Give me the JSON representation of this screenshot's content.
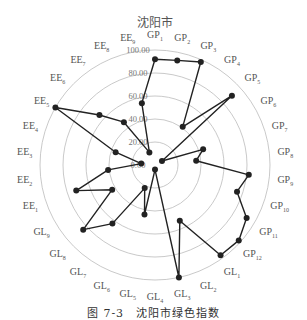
{
  "chart_data": {
    "type": "radar",
    "title": "沈阳市",
    "caption": "图 7-3　沈阳市绿色指数",
    "axes": [
      "GP1",
      "GP2",
      "GP3",
      "GP4",
      "GP5",
      "GP6",
      "GP7",
      "GP8",
      "GP9",
      "GP10",
      "GP11",
      "GP12",
      "GL1",
      "GL2",
      "GL3",
      "GL4",
      "GL5",
      "GL6",
      "GL7",
      "GL8",
      "GL9",
      "EE1",
      "EE2",
      "EE3",
      "EE4",
      "EE5",
      "EE6",
      "EE7",
      "EE8",
      "EE9"
    ],
    "axis_labels": [
      {
        "base": "GP",
        "sub": "1"
      },
      {
        "base": "GP",
        "sub": "2"
      },
      {
        "base": "GP",
        "sub": "3"
      },
      {
        "base": "GP",
        "sub": "4"
      },
      {
        "base": "GP",
        "sub": "5"
      },
      {
        "base": "GP",
        "sub": "6"
      },
      {
        "base": "GP",
        "sub": "7"
      },
      {
        "base": "GP",
        "sub": "8"
      },
      {
        "base": "GP",
        "sub": "9"
      },
      {
        "base": "GP",
        "sub": "10"
      },
      {
        "base": "GP",
        "sub": "11"
      },
      {
        "base": "GP",
        "sub": "12"
      },
      {
        "base": "GL",
        "sub": "1"
      },
      {
        "base": "GL",
        "sub": "2"
      },
      {
        "base": "GL",
        "sub": "3"
      },
      {
        "base": "GL",
        "sub": "4"
      },
      {
        "base": "GL",
        "sub": "5"
      },
      {
        "base": "GL",
        "sub": "6"
      },
      {
        "base": "GL",
        "sub": "7"
      },
      {
        "base": "GL",
        "sub": "8"
      },
      {
        "base": "GL",
        "sub": "9"
      },
      {
        "base": "EE",
        "sub": "1"
      },
      {
        "base": "EE",
        "sub": "2"
      },
      {
        "base": "EE",
        "sub": "3"
      },
      {
        "base": "EE",
        "sub": "4"
      },
      {
        "base": "EE",
        "sub": "5"
      },
      {
        "base": "EE",
        "sub": "6"
      },
      {
        "base": "EE",
        "sub": "7"
      },
      {
        "base": "EE",
        "sub": "8"
      },
      {
        "base": "EE",
        "sub": "9"
      }
    ],
    "series": [
      {
        "name": "沈阳市",
        "values": [
          92,
          93,
          98,
          41,
          90,
          7,
          44,
          36,
          82,
          75,
          92,
          98,
          97,
          53,
          100,
          4,
          44,
          22,
          63,
          84,
          43,
          72,
          41,
          12,
          36,
          100,
          65,
          46,
          12,
          55
        ]
      }
    ],
    "rings": [
      0,
      20,
      40,
      60,
      80,
      100
    ],
    "ring_labels": [
      "0.00",
      "20.00",
      "40.00",
      "60.00",
      "80.00",
      "100.00"
    ],
    "rlim": [
      0,
      100
    ],
    "grid": true,
    "legend": "none",
    "line_color": "#222222",
    "grid_color": "#bbbbbb"
  }
}
